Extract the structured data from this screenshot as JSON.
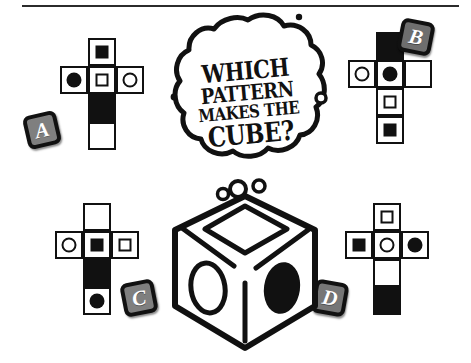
{
  "page": {
    "title": "Which pattern makes the cube?",
    "background": "#ffffff",
    "ink": "#111111",
    "tile_gray": "#7f7f7f",
    "rule_color": "#2b2b2b"
  },
  "question": {
    "line1": "WHICH",
    "line2": "PATTERN",
    "line3": "MAKES THE",
    "line4": "CUBE?"
  },
  "cube": {
    "name": "target-cube",
    "top_face_glyph": "square-outline",
    "left_face_glyph": "ellipse-outline",
    "right_face_glyph": "ellipse-filled"
  },
  "options": [
    {
      "letter": "A",
      "name": "pattern-a",
      "cells": [
        {
          "row": 0,
          "col": 1,
          "fill": "white",
          "glyph": "square-filled"
        },
        {
          "row": 1,
          "col": 0,
          "fill": "white",
          "glyph": "circle-filled"
        },
        {
          "row": 1,
          "col": 1,
          "fill": "white",
          "glyph": "square-outline"
        },
        {
          "row": 1,
          "col": 2,
          "fill": "white",
          "glyph": "circle-outline"
        },
        {
          "row": 2,
          "col": 1,
          "fill": "black",
          "glyph": "none"
        },
        {
          "row": 3,
          "col": 1,
          "fill": "white",
          "glyph": "none"
        }
      ]
    },
    {
      "letter": "B",
      "name": "pattern-b",
      "cells": [
        {
          "row": 0,
          "col": 1,
          "fill": "black",
          "glyph": "none"
        },
        {
          "row": 1,
          "col": 0,
          "fill": "white",
          "glyph": "circle-outline"
        },
        {
          "row": 1,
          "col": 1,
          "fill": "white",
          "glyph": "circle-filled"
        },
        {
          "row": 1,
          "col": 2,
          "fill": "white",
          "glyph": "none"
        },
        {
          "row": 2,
          "col": 1,
          "fill": "white",
          "glyph": "square-outline"
        },
        {
          "row": 3,
          "col": 1,
          "fill": "white",
          "glyph": "square-filled"
        }
      ]
    },
    {
      "letter": "C",
      "name": "pattern-c",
      "cells": [
        {
          "row": 0,
          "col": 1,
          "fill": "white",
          "glyph": "none"
        },
        {
          "row": 1,
          "col": 0,
          "fill": "white",
          "glyph": "circle-outline"
        },
        {
          "row": 1,
          "col": 1,
          "fill": "white",
          "glyph": "square-filled"
        },
        {
          "row": 1,
          "col": 2,
          "fill": "white",
          "glyph": "square-outline"
        },
        {
          "row": 2,
          "col": 1,
          "fill": "black",
          "glyph": "none"
        },
        {
          "row": 3,
          "col": 1,
          "fill": "white",
          "glyph": "circle-filled"
        }
      ]
    },
    {
      "letter": "D",
      "name": "pattern-d",
      "cells": [
        {
          "row": 0,
          "col": 1,
          "fill": "white",
          "glyph": "square-outline"
        },
        {
          "row": 1,
          "col": 0,
          "fill": "white",
          "glyph": "square-filled"
        },
        {
          "row": 1,
          "col": 1,
          "fill": "white",
          "glyph": "circle-outline"
        },
        {
          "row": 1,
          "col": 2,
          "fill": "white",
          "glyph": "circle-filled"
        },
        {
          "row": 2,
          "col": 1,
          "fill": "white",
          "glyph": "none"
        },
        {
          "row": 3,
          "col": 1,
          "fill": "black",
          "glyph": "none"
        }
      ]
    }
  ]
}
